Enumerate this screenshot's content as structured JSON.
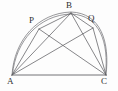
{
  "figure": {
    "type": "geometry-diagram",
    "background_color": "#fdfdfd",
    "line_color": "#5f5f63",
    "label_color": "#2e2e31",
    "canvas": {
      "width": 118,
      "height": 91
    }
  },
  "points": {
    "A": {
      "label": "A",
      "x": 12,
      "y": 75,
      "label_x": 7,
      "label_y": 77
    },
    "B": {
      "label": "B",
      "x": 71,
      "y": 13,
      "label_x": 66,
      "label_y": 1
    },
    "C": {
      "label": "C",
      "x": 106,
      "y": 75,
      "label_x": 101,
      "label_y": 77
    },
    "P": {
      "label": "P",
      "x": 39,
      "y": 29,
      "label_x": 29,
      "label_y": 16
    },
    "Q": {
      "label": "Q",
      "x": 93,
      "y": 28,
      "label_x": 88,
      "label_y": 14
    }
  },
  "segments": [
    {
      "name": "AC",
      "from": "A",
      "to": "C",
      "kind": "base"
    },
    {
      "name": "AB",
      "from": "A",
      "to": "B",
      "kind": "chord"
    },
    {
      "name": "AP",
      "from": "A",
      "to": "P",
      "kind": "chord"
    },
    {
      "name": "AQ",
      "from": "A",
      "to": "Q",
      "kind": "chord"
    },
    {
      "name": "PB",
      "from": "P",
      "to": "B",
      "kind": "chord"
    },
    {
      "name": "BQ",
      "from": "B",
      "to": "Q",
      "kind": "chord"
    },
    {
      "name": "BC",
      "from": "B",
      "to": "C",
      "kind": "chord"
    },
    {
      "name": "PC",
      "from": "P",
      "to": "C",
      "kind": "chord"
    },
    {
      "name": "QC",
      "from": "Q",
      "to": "C",
      "kind": "chord"
    }
  ],
  "arcs": [
    {
      "name": "arc-A-P-B-Q-C",
      "from": "A",
      "to": "C",
      "through": "B",
      "kind": "circumcircle-arc"
    }
  ],
  "labels": {
    "A": "A",
    "B": "B",
    "C": "C",
    "P": "P",
    "Q": "Q"
  }
}
